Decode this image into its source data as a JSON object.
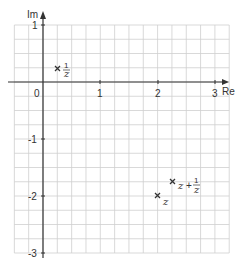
{
  "axes": {
    "x_label": "Re",
    "y_label": "Im",
    "x_ticks": [
      "0",
      "1",
      "2",
      "3"
    ],
    "y_ticks": [
      "1",
      "-1",
      "-2",
      "-3"
    ],
    "xlim": [
      -0.5,
      3.25
    ],
    "ylim": [
      -3,
      1
    ],
    "grid_step": 0.25
  },
  "points": [
    {
      "label_num": "1",
      "label_den": "z",
      "prefix": "",
      "re": 0.25,
      "im": 0.25
    },
    {
      "label": "z",
      "re": 2,
      "im": -2
    },
    {
      "label_prefix": "z +",
      "label_num": "1",
      "label_den": "z",
      "re": 2.25,
      "im": -1.75
    }
  ],
  "colors": {
    "grid": "#cccccc",
    "axis": "#333333",
    "marker": "#333333"
  }
}
